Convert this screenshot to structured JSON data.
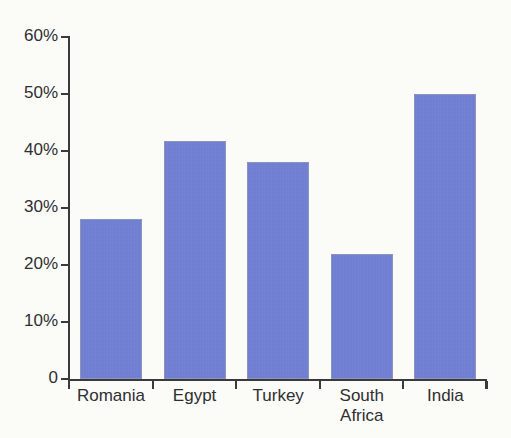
{
  "chart_data": {
    "type": "bar",
    "title": "",
    "subtitle": "",
    "xlabel": "",
    "ylabel": "",
    "categories": [
      "Romania",
      "Egypt",
      "Turkey",
      "South\nAfrica",
      "India"
    ],
    "values": [
      28,
      41.7,
      38,
      22,
      50
    ],
    "ylim": [
      0,
      60
    ],
    "y_ticks": [
      0,
      10,
      20,
      30,
      40,
      50,
      60
    ],
    "y_tick_labels": [
      "0",
      "10%",
      "20%",
      "30%",
      "40%",
      "50%",
      "60%"
    ],
    "grid": false,
    "legend": false,
    "series": [
      {
        "name": "",
        "values": [
          28,
          41.7,
          38,
          22,
          50
        ]
      }
    ],
    "colors": {
      "bar_fill": "#6f7fd4",
      "bar_border": "#8d93bd",
      "axis": "#3a3a3c",
      "text": "#2f2f31",
      "background": "#fbfbf8"
    }
  }
}
